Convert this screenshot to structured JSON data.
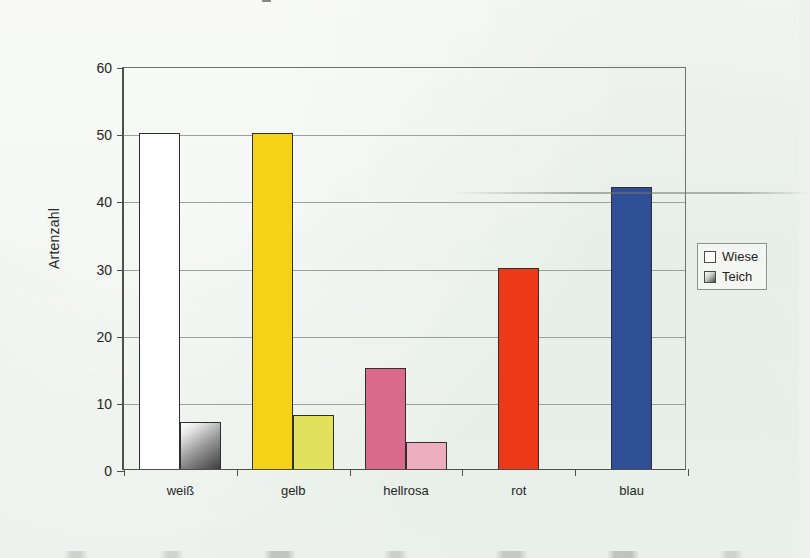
{
  "figure": {
    "background_color": "#eef2ee",
    "plot_border_color": "#4c4f4c",
    "gridline_color": "#9aa39a"
  },
  "legend": {
    "position": "right",
    "items": [
      {
        "label": "Wiese",
        "swatch_name": "legend-swatch-wiese",
        "fill": "#ffffff"
      },
      {
        "label": "Teich",
        "swatch_name": "legend-swatch-teich",
        "fill": "linear-gradient(135deg,#ffffff 0%,#c9cdc9 45%,#4a4d4a 100%)"
      }
    ]
  },
  "chart_data": {
    "type": "bar",
    "title": "",
    "subtitle": "",
    "xlabel": "",
    "ylabel": "Artenzahl",
    "categories": [
      "weiß",
      "gelb",
      "hellrosa",
      "rot",
      "blau"
    ],
    "series": [
      {
        "name": "Wiese",
        "values": [
          50,
          50,
          15,
          30,
          42
        ]
      },
      {
        "name": "Teich",
        "values": [
          7,
          8,
          4,
          0,
          0
        ]
      }
    ],
    "ylim": [
      0,
      60
    ],
    "yticks": [
      0,
      10,
      20,
      30,
      40,
      50,
      60
    ],
    "ytick_labels": [
      "0",
      "10",
      "20",
      "30",
      "40",
      "50",
      "60"
    ],
    "grid": true,
    "grid_axis": "y",
    "legend_position": "right",
    "bar_colors": {
      "weiß": {
        "Wiese": "#ffffff",
        "Teich": "linear-gradient(145deg,#ffffff 0%,#e8e8e8 18%,#9a9a9a 52%,#3c3c3c 100%)"
      },
      "gelb": {
        "Wiese": "#f5d215",
        "Teich": "#e1e25c"
      },
      "hellrosa": {
        "Wiese": "#d9698d",
        "Teich": "#eeaec2"
      },
      "rot": {
        "Wiese": "#ec3a18",
        "Teich": ""
      },
      "blau": {
        "Wiese": "#2e4f96",
        "Teich": ""
      }
    },
    "annotations": []
  }
}
